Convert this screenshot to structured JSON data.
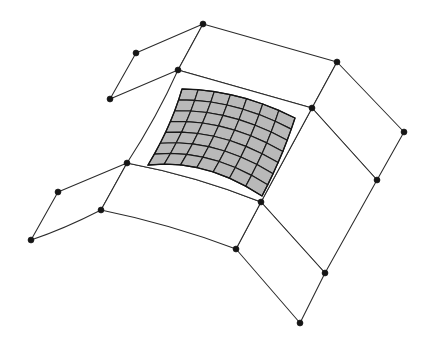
{
  "figure": {
    "title": "Quadrilateral surface patch mesh with locally refined shaded patch",
    "background_color": "#ffffff",
    "line_color": "#2b2b2b",
    "node_color": "#161616",
    "refined_fill_color": "#b9b9b9",
    "refined_line_color": "#1a1a1a",
    "node_radius": 3.0,
    "node_count": 16,
    "face_count": 8
  },
  "chart_data": {
    "type": "diagram",
    "title": "Quadrilateral surface patch mesh with locally refined shaded patch",
    "xlabel": "",
    "ylabel": "",
    "xlim": [
      0,
      424
    ],
    "ylim": [
      0,
      337
    ],
    "grid": false,
    "legend": "none",
    "refined_patch": {
      "rows": 7,
      "columns": 7,
      "cell_count": 49,
      "fill": "#b9b9b9",
      "corners": {
        "top_left": [
          182,
          89
        ],
        "top_right": [
          295,
          118
        ],
        "bottom_right": [
          262,
          196
        ],
        "bottom_left": [
          148,
          165
        ]
      },
      "bulge": {
        "top_edge": -7,
        "bottom_edge": -11,
        "left_edge": 3,
        "right_edge": 2
      }
    },
    "control_nodes": [
      {
        "id": "n-apex-top",
        "x": 203,
        "y": 24
      },
      {
        "id": "n-upper-left",
        "x": 136,
        "y": 53
      },
      {
        "id": "n-left-upper",
        "x": 110,
        "y": 99
      },
      {
        "id": "n-center-top",
        "x": 178,
        "y": 70
      },
      {
        "id": "n-center-left",
        "x": 127,
        "y": 163
      },
      {
        "id": "n-left-lower",
        "x": 58,
        "y": 192
      },
      {
        "id": "n-far-left-bottom",
        "x": 31,
        "y": 240
      },
      {
        "id": "n-lower-left-inner",
        "x": 101,
        "y": 210
      },
      {
        "id": "n-right-upper",
        "x": 337,
        "y": 62
      },
      {
        "id": "n-center-right",
        "x": 312,
        "y": 108
      },
      {
        "id": "n-far-right",
        "x": 404,
        "y": 132
      },
      {
        "id": "n-right-lower",
        "x": 377,
        "y": 180
      },
      {
        "id": "n-center-bottom",
        "x": 261,
        "y": 202
      },
      {
        "id": "n-lower-inner",
        "x": 236,
        "y": 249
      },
      {
        "id": "n-right-bottom",
        "x": 325,
        "y": 273
      },
      {
        "id": "n-bottom-apex",
        "x": 300,
        "y": 323
      }
    ],
    "faces": [
      {
        "id": "face-top-left-outer",
        "label": "upper-left outer patch",
        "vertices": [
          [
            203,
            24
          ],
          [
            136,
            53
          ],
          [
            110,
            99
          ],
          [
            178,
            70
          ]
        ]
      },
      {
        "id": "face-top-right-outer",
        "label": "upper-right outer patch",
        "vertices": [
          [
            203,
            24
          ],
          [
            337,
            62
          ],
          [
            312,
            108
          ],
          [
            178,
            70
          ]
        ]
      },
      {
        "id": "face-right-outer",
        "label": "right outer patch",
        "vertices": [
          [
            337,
            62
          ],
          [
            404,
            132
          ],
          [
            377,
            180
          ],
          [
            312,
            108
          ]
        ]
      },
      {
        "id": "face-right-lower",
        "label": "right lower patch",
        "vertices": [
          [
            312,
            108
          ],
          [
            377,
            180
          ],
          [
            325,
            273
          ],
          [
            261,
            202
          ]
        ]
      },
      {
        "id": "face-bottom-outer",
        "label": "bottom outer patch",
        "vertices": [
          [
            261,
            202
          ],
          [
            325,
            273
          ],
          [
            300,
            323
          ],
          [
            236,
            249
          ]
        ]
      },
      {
        "id": "face-left-lower",
        "label": "left lower patch",
        "vertices": [
          [
            127,
            163
          ],
          [
            58,
            192
          ],
          [
            31,
            240
          ],
          [
            101,
            210
          ]
        ]
      },
      {
        "id": "face-bottom-left",
        "label": "bottom-left patch",
        "vertices": [
          [
            127,
            163
          ],
          [
            101,
            210
          ],
          [
            236,
            249
          ],
          [
            261,
            202
          ]
        ]
      },
      {
        "id": "face-center-refined",
        "label": "center patch containing refined grid",
        "vertices": [
          [
            178,
            70
          ],
          [
            312,
            108
          ],
          [
            261,
            202
          ],
          [
            127,
            163
          ]
        ]
      }
    ],
    "curved_edges": [
      {
        "from": [
          110,
          99
        ],
        "to": [
          127,
          163
        ],
        "control": [
          112,
          131
        ]
      },
      {
        "from": [
          178,
          70
        ],
        "to": [
          127,
          163
        ],
        "control": [
          157,
          117
        ]
      },
      {
        "from": [
          127,
          163
        ],
        "to": [
          261,
          202
        ],
        "control": [
          196,
          176
        ]
      },
      {
        "from": [
          101,
          210
        ],
        "to": [
          236,
          249
        ],
        "control": [
          170,
          224
        ]
      },
      {
        "from": [
          31,
          240
        ],
        "to": [
          101,
          210
        ],
        "control": [
          64,
          229
        ]
      }
    ]
  }
}
